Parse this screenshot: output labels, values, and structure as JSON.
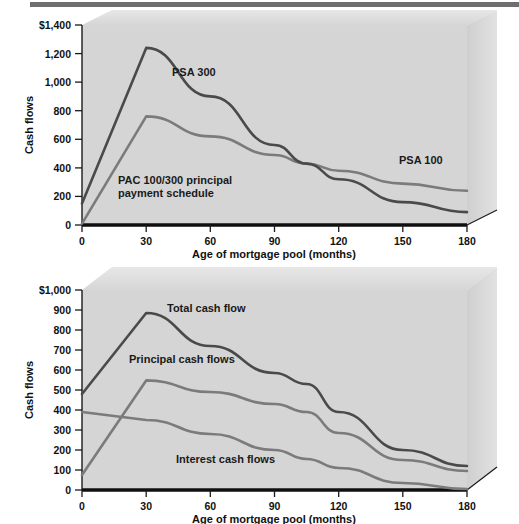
{
  "figures": [
    {
      "id": "psa-prepayment-chart",
      "chart_data": {
        "type": "line",
        "title": "",
        "xlabel": "Age of mortgage pool (months)",
        "ylabel": "Cash flows",
        "xlim": [
          0,
          180
        ],
        "ylim": [
          0,
          1400
        ],
        "xticks": [
          0,
          30,
          60,
          90,
          120,
          150,
          180
        ],
        "yticks": [
          0,
          200,
          400,
          600,
          800,
          1000,
          1200,
          1400
        ],
        "xticklabels": [
          "0",
          "30",
          "60",
          "90",
          "120",
          "150",
          "180"
        ],
        "yticklabels": [
          "0",
          "200",
          "400",
          "600",
          "800",
          "1,000",
          "1,200",
          "$1,400"
        ],
        "grid": false,
        "legend_position": "inline-annotations",
        "x": [
          0,
          30,
          60,
          90,
          105,
          120,
          150,
          180
        ],
        "series": [
          {
            "name": "PSA 300",
            "label": "PSA 300",
            "color": "#4a4a4a",
            "values": [
              150,
              1240,
              900,
              560,
              430,
              320,
              160,
              90
            ]
          },
          {
            "name": "PSA 100",
            "label": "PSA 100",
            "color": "#7b7b7b",
            "values": [
              10,
              760,
              620,
              490,
              430,
              380,
              290,
              240
            ]
          }
        ],
        "annotations": [
          {
            "text": "PSA 300",
            "x": 45,
            "y": 1120
          },
          {
            "text": "PAC 100/300 principal",
            "x": 30,
            "y": 300
          },
          {
            "text": "payment schedule",
            "x": 30,
            "y": 215
          },
          {
            "text": "PSA 100",
            "x": 148,
            "y": 420
          }
        ]
      }
    },
    {
      "id": "cash-flow-components-chart",
      "chart_data": {
        "type": "line",
        "title": "",
        "xlabel": "Age of mortgage pool (months)",
        "ylabel": "Cash flows",
        "xlim": [
          0,
          180
        ],
        "ylim": [
          0,
          1000
        ],
        "xticks": [
          0,
          30,
          60,
          90,
          120,
          150,
          180
        ],
        "yticks": [
          0,
          100,
          200,
          300,
          400,
          500,
          600,
          700,
          800,
          900,
          1000
        ],
        "xticklabels": [
          "0",
          "30",
          "60",
          "90",
          "120",
          "150",
          "180"
        ],
        "yticklabels": [
          "0",
          "100",
          "200",
          "300",
          "400",
          "500",
          "600",
          "700",
          "800",
          "900",
          "$1,000"
        ],
        "grid": false,
        "legend_position": "inline-annotations",
        "x": [
          0,
          30,
          60,
          90,
          105,
          120,
          150,
          180
        ],
        "series": [
          {
            "name": "Total cash flow",
            "label": "Total cash flow",
            "color": "#4a4a4a",
            "values": [
              480,
              885,
              720,
              585,
              530,
              390,
              200,
              120
            ]
          },
          {
            "name": "Principal cash flows",
            "label": "Principal cash flows",
            "color": "#7b7b7b",
            "values": [
              75,
              548,
              490,
              430,
              390,
              285,
              150,
              95
            ]
          },
          {
            "name": "Interest cash flows",
            "label": "Interest cash flows",
            "color": "#7b7b7b",
            "values": [
              390,
              350,
              280,
              200,
              155,
              110,
              35,
              5
            ]
          }
        ],
        "annotations": [
          {
            "text": "Total cash flow",
            "x": 42,
            "y": 880
          },
          {
            "text": "Principal cash flows",
            "x": 22,
            "y": 610
          },
          {
            "text": "Interest cash flows",
            "x": 45,
            "y": 110
          }
        ]
      }
    }
  ]
}
